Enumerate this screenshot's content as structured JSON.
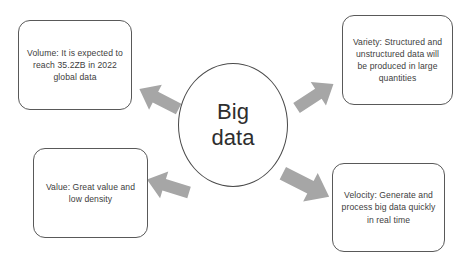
{
  "diagram": {
    "title_center": "Big\ndata",
    "background_color": "#ffffff",
    "box_border_color": "#595959",
    "arrow_color": "#a6a6a6",
    "text_color": "#404040",
    "nodes": [
      {
        "key": "volume",
        "label": "Volume: It is expected to reach 35.2ZB in 2022 global data",
        "position": "top-left",
        "arrow": "up-left"
      },
      {
        "key": "variety",
        "label": "Variety: Structured and unstructured data will be produced in large quantities",
        "position": "top-right",
        "arrow": "up-right"
      },
      {
        "key": "value",
        "label": "Value: Great value and low density",
        "position": "bottom-left",
        "arrow": "down-left"
      },
      {
        "key": "velocity",
        "label": "Velocity: Generate and process big data quickly in real time",
        "position": "bottom-right",
        "arrow": "down-right"
      }
    ]
  }
}
